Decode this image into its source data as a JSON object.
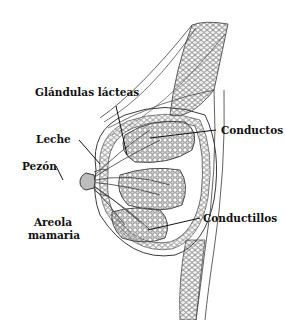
{
  "diagram": {
    "labels": {
      "glandulas": "Glándulas lácteas",
      "leche": "Leche",
      "pezon": "Pezón",
      "areola_line1": "Areola",
      "areola_line2": "mamaria",
      "conductos": "Conductos",
      "conductillos": "Conductillos"
    },
    "colors": {
      "line": "#3a3a3a",
      "fill_lobule": "#d9d9d9",
      "background": "#ffffff",
      "text": "#111111"
    }
  }
}
